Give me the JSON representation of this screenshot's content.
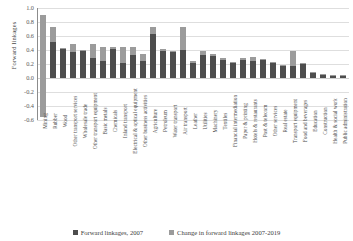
{
  "chart_data": {
    "type": "bar",
    "title": "",
    "subtitle": "",
    "xlabel": "",
    "ylabel": "Forward linkages",
    "ylim": [
      -0.6,
      1.0
    ],
    "ytick_values": [
      1.0,
      0.8,
      0.6,
      0.4,
      0.2,
      0.0,
      -0.2,
      -0.4,
      -0.6
    ],
    "ytick_labels": [
      "1.0",
      "0.8",
      "0.6",
      "0.4",
      "0.2",
      "0.0",
      "-0.2",
      "-0.4",
      "-0.6"
    ],
    "grid": true,
    "stacked": true,
    "legend_position": "bottom",
    "categories": [
      "Mining",
      "Rubber",
      "Wood",
      "Other transport services",
      "Wholesale trade",
      "Other transport equipment",
      "Basic metals",
      "Chemicals",
      "Inland transport",
      "Electrical & optical equipment",
      "Other business activities",
      "Agriculture",
      "Petroleum",
      "Water transport",
      "Air transport",
      "Leather",
      "Utilities",
      "Machinery",
      "Textiles",
      "Financial intermediation",
      "Paper & printing",
      "Hotels & restaurants",
      "Post & telecom",
      "Other services",
      "Real estate",
      "Transport equipment",
      "Food and beverages",
      "Education",
      "Construction",
      "Health & social work",
      "Public administration"
    ],
    "series": [
      {
        "name": "Forward linkages, 2007",
        "color": "#4d4d4d",
        "values": [
          0.9,
          0.52,
          0.41,
          0.37,
          0.4,
          0.29,
          0.24,
          0.41,
          0.22,
          0.33,
          0.24,
          0.63,
          0.41,
          0.38,
          0.4,
          0.22,
          0.33,
          0.35,
          0.28,
          0.23,
          0.28,
          0.3,
          0.27,
          0.22,
          0.18,
          0.17,
          0.22,
          0.08,
          0.06,
          0.05,
          0.04
        ]
      },
      {
        "name": "Change in forward linkages 2007-2019",
        "color": "#9b9b9b",
        "values": [
          -1.45,
          0.21,
          0.02,
          0.11,
          -0.01,
          0.19,
          0.21,
          0.04,
          0.23,
          0.12,
          0.1,
          0.1,
          -0.02,
          0.01,
          0.33,
          0.02,
          0.06,
          -0.03,
          -0.02,
          -0.01,
          -0.03,
          -0.06,
          -0.01,
          0.01,
          -0.01,
          0.22,
          -0.02,
          -0.01,
          -0.01,
          0.0,
          0.0
        ]
      }
    ],
    "totals_2019": [
      -0.55,
      0.73,
      0.43,
      0.48,
      0.39,
      0.48,
      0.45,
      0.45,
      0.45,
      0.45,
      0.34,
      0.73,
      0.39,
      0.39,
      0.73,
      0.24,
      0.39,
      0.32,
      0.26,
      0.22,
      0.25,
      0.24,
      0.26,
      0.23,
      0.17,
      0.39,
      0.2,
      0.07,
      0.05,
      0.05,
      0.04
    ]
  },
  "legend": {
    "items": [
      {
        "label": "Forward linkages, 2007"
      },
      {
        "label": "Change in forward linkages 2007-2019"
      }
    ]
  }
}
